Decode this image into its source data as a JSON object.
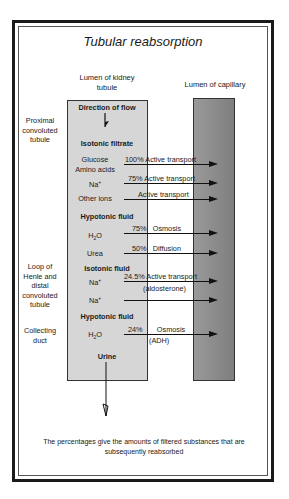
{
  "title": "Tubular reabsorption",
  "columns": {
    "tubule": [
      "Lumen of kidney",
      "tubule"
    ],
    "capillary": "Lumen of capillary"
  },
  "regions": {
    "proximal": [
      "Proximal",
      "convoluted",
      "tubule"
    ],
    "loop": [
      "Loop of",
      "Henle and",
      "distal",
      "convoluted",
      "tubule"
    ],
    "collecting": [
      "Collecting",
      "duct"
    ]
  },
  "flow_label": "Direction of flow",
  "sections": {
    "isotonic_filtrate": "Isotonic filtrate",
    "hypotonic_fluid_1": "Hypotonic fluid",
    "isotonic_fluid": "Isotonic fluid",
    "hypotonic_fluid_2": "Hypotonic fluid",
    "urine": "Urine"
  },
  "substances": {
    "glucose": "Glucose",
    "amino_acids": "Amino acids",
    "na1": "Na",
    "other_ions": "Other ions",
    "h2o_1": "H",
    "urea": "Urea",
    "na2": "Na",
    "na3": "Na",
    "h2o_2": "H"
  },
  "transport": [
    {
      "pct": "100%",
      "mechanism": "Active transport",
      "note": ""
    },
    {
      "pct": "75%",
      "mechanism": "Active transport",
      "note": ""
    },
    {
      "pct": "",
      "mechanism": "Active transport",
      "note": ""
    },
    {
      "pct": "75%",
      "mechanism": "Osmosis",
      "note": ""
    },
    {
      "pct": "50%",
      "mechanism": "Diffusion",
      "note": ""
    },
    {
      "pct": "24.5%",
      "mechanism": "Active transport",
      "note": "(aldosterone)"
    },
    {
      "pct": "",
      "mechanism": "",
      "note": ""
    },
    {
      "pct": "24%",
      "mechanism": "Osmosis",
      "note": "(ADH)"
    }
  ],
  "caption": [
    "The percentages give the amounts of filtered substances that are",
    "subsequently reabsorbed"
  ],
  "colors": {
    "tubule": "#d6d6d6",
    "capillary": "#8e8e8e",
    "border": "#1a1a1a"
  }
}
